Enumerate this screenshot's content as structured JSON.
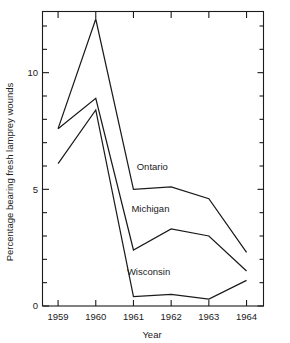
{
  "chart_data": {
    "type": "line",
    "title": "",
    "xlabel": "Year",
    "ylabel": "Percentage bearing fresh lamprey wounds",
    "x": [
      1959,
      1960,
      1961,
      1962,
      1963,
      1964
    ],
    "xticklabels": [
      "1959",
      "1960",
      "1961",
      "1962",
      "1963",
      "1964"
    ],
    "yticklabels": [
      "0",
      "5",
      "10"
    ],
    "ymajor": [
      0,
      5,
      10
    ],
    "yminor": [
      1,
      2,
      3,
      4,
      6,
      7,
      8,
      9,
      11,
      12
    ],
    "ylim": [
      0,
      12.6
    ],
    "xlim": [
      1958.6,
      1964.45
    ],
    "grid": false,
    "legend_position": "inline-annotations",
    "series": [
      {
        "name": "Ontario",
        "values": [
          7.6,
          12.3,
          5.0,
          5.1,
          4.6,
          2.3
        ],
        "label_x": 1961.5,
        "label_y": 5.85,
        "clipped_at_top": true
      },
      {
        "name": "Michigan",
        "values": [
          7.6,
          8.9,
          2.4,
          3.3,
          3.0,
          1.5
        ],
        "label_x": 1961.45,
        "label_y": 4.05
      },
      {
        "name": "Wisconsin",
        "values": [
          6.1,
          8.4,
          0.4,
          0.5,
          0.3,
          1.1
        ],
        "label_x": 1961.4,
        "label_y": 1.35
      }
    ],
    "annotations": [
      "Ontario",
      "Michigan",
      "Wisconsin"
    ],
    "colors": {
      "line": "#1b1b1b",
      "axis": "#1b1b1b",
      "background": "#ffffff"
    }
  }
}
